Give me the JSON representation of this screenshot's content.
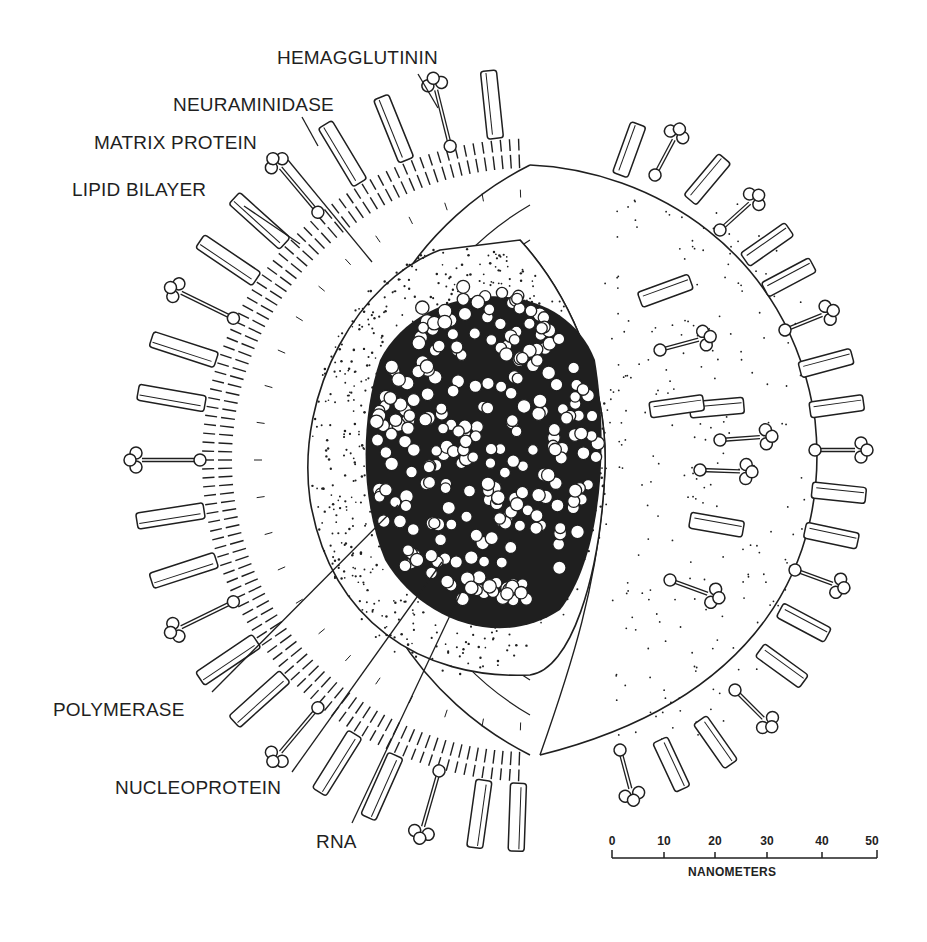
{
  "diagram": {
    "labels": {
      "hemagglutinin": "HEMAGGLUTININ",
      "neuraminidase": "NEURAMINIDASE",
      "matrix_protein": "MATRIX PROTEIN",
      "lipid_bilayer": "LIPID BILAYER",
      "polymerase": "POLYMERASE",
      "nucleoprotein": "NUCLEOPROTEIN",
      "rna": "RNA"
    },
    "scale_bar": {
      "ticks": [
        "0",
        "10",
        "20",
        "30",
        "40",
        "50"
      ],
      "unit": "NANOMETERS"
    },
    "colors": {
      "ink": "#1f1f1f",
      "background": "#ffffff",
      "bead_fill": "#ffffff"
    }
  }
}
